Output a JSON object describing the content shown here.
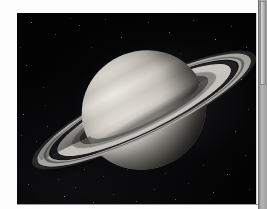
{
  "page": {
    "background_color": "#fdfdfd",
    "rule_color": "#9a9a9a"
  },
  "photo": {
    "subject": "saturn",
    "alt_text": "Photograph of the planet Saturn and its ring system against a black starfield",
    "frame_background": "#000000",
    "planet": {
      "name": "Saturn",
      "highlight_color": "#e9e6df",
      "midtone_color": "#c6c2b9",
      "shadow_color": "#23221f"
    },
    "rings": [
      {
        "name": "outer-haze",
        "brightness": "faint",
        "color": "#969696"
      },
      {
        "name": "a-ring",
        "brightness": "bright",
        "color": "#b2b0aa"
      },
      {
        "name": "encke-lane",
        "brightness": "dark",
        "color": "#605f5c"
      },
      {
        "name": "cassini-division",
        "brightness": "dark-gap",
        "color": "#222224"
      },
      {
        "name": "b-ring",
        "brightness": "brightest",
        "color": "#ceccc6"
      },
      {
        "name": "b-ring-inner",
        "brightness": "medium",
        "color": "#96948f"
      },
      {
        "name": "c-ring",
        "brightness": "translucent",
        "color": "#605f5c"
      }
    ],
    "starfield_color": "#ffffff"
  },
  "scrollbar": {
    "orientation": "vertical",
    "track_color": "#a0a0a0",
    "thumb_color": "#bdbdbd",
    "thumb_position": "top"
  }
}
